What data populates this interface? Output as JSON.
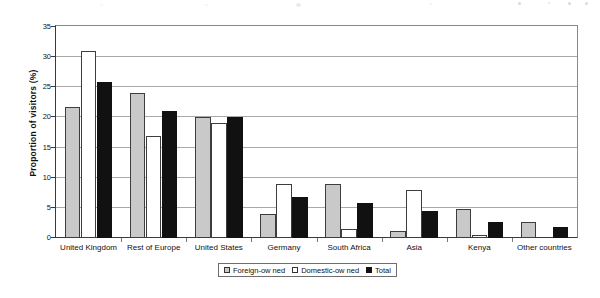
{
  "chart_data": {
    "type": "bar",
    "title": "",
    "xlabel": "",
    "ylabel": "Proportion of visitors (%)",
    "ylim": [
      0,
      35
    ],
    "yticks": [
      0,
      5,
      10,
      15,
      20,
      25,
      30,
      35
    ],
    "grid": true,
    "legend_position": "bottom-center",
    "categories": [
      "United Kingdom",
      "Rest of Europe",
      "United States",
      "Germany",
      "South Africa",
      "Asia",
      "Kenya",
      "Other countries"
    ],
    "series": [
      {
        "name": "Foreign-ow ned",
        "color": "#c9c9c9",
        "values": [
          21.8,
          24.0,
          20.0,
          4.0,
          8.9,
          1.2,
          4.8,
          2.7
        ]
      },
      {
        "name": "Domestic-ow ned",
        "color": "#ffffff",
        "values": [
          31.0,
          17.0,
          19.0,
          8.9,
          1.5,
          7.9,
          0.5,
          0.0
        ]
      },
      {
        "name": "Total",
        "color": "#111111",
        "values": [
          25.9,
          21.0,
          20.0,
          6.8,
          5.8,
          4.5,
          2.7,
          1.8
        ]
      }
    ]
  },
  "axis": {
    "y_title": "Proportion of visitors (%)",
    "y_tick_labels": [
      "0",
      "5",
      "10",
      "15",
      "20",
      "25",
      "30",
      "35"
    ]
  },
  "legend": {
    "items": [
      {
        "label": "Foreign-ow ned",
        "swatch": "foreign"
      },
      {
        "label": "Domestic-ow ned",
        "swatch": "domestic"
      },
      {
        "label": "Total",
        "swatch": "total"
      }
    ]
  }
}
